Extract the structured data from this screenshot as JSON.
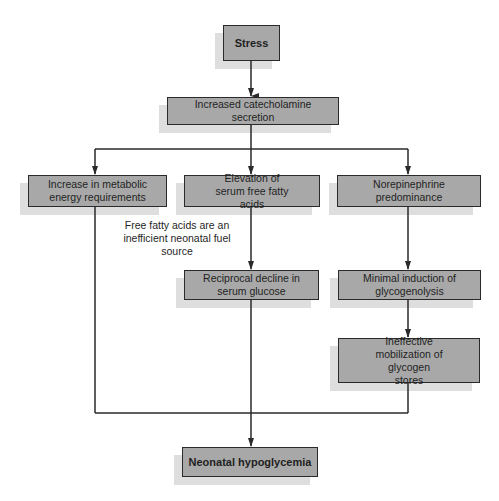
{
  "diagram": {
    "type": "flowchart",
    "nodes": {
      "stress": "Stress",
      "catecholamine": "Increased catecholamine secretion",
      "metabolic": "Increase in metabolic energy requirements",
      "fatty_acids": "Elevation of serum free fatty acids",
      "norepinephrine": "Norepinephrine predominance",
      "glucose_decline": "Reciprocal decline in serum glucose",
      "glycogenolysis": "Minimal induction of glycogenolysis",
      "glycogen_stores": "Ineffective mobilization of glycogen stores",
      "hypoglycemia": "Neonatal hypoglycemia"
    },
    "annotation": "Free fatty acids are an inefficient neonatal fuel source",
    "edges": [
      [
        "stress",
        "catecholamine"
      ],
      [
        "catecholamine",
        "metabolic"
      ],
      [
        "catecholamine",
        "fatty_acids"
      ],
      [
        "catecholamine",
        "norepinephrine"
      ],
      [
        "fatty_acids",
        "glucose_decline"
      ],
      [
        "norepinephrine",
        "glycogenolysis"
      ],
      [
        "glycogenolysis",
        "glycogen_stores"
      ],
      [
        "metabolic",
        "hypoglycemia"
      ],
      [
        "glucose_decline",
        "hypoglycemia"
      ],
      [
        "glycogen_stores",
        "hypoglycemia"
      ]
    ],
    "colors": {
      "box_fill": "#a8a8a8",
      "shadow": "#dedede",
      "line": "#2a2a2a"
    }
  }
}
